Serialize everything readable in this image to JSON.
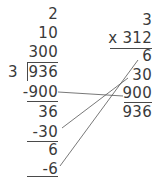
{
  "division": {
    "divisor": "3",
    "dividend": "936",
    "partial_quotients": [
      "2",
      "10",
      "300"
    ],
    "steps": [
      {
        "subtract": "-900",
        "remainder": "36"
      },
      {
        "subtract": "-30",
        "remainder": "6"
      },
      {
        "subtract": "-6",
        "remainder": ""
      }
    ]
  },
  "multiplication": {
    "multiplicand": "3",
    "multiplier": "x 312",
    "partial_products": [
      "6",
      "30",
      "900"
    ],
    "total": "936"
  },
  "colors": {
    "text": "#3a3a3a",
    "lines": "#4a4a4a",
    "background": "#ffffff"
  }
}
